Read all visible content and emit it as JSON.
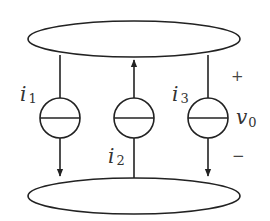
{
  "diagram": {
    "type": "circuit",
    "nodes": [
      {
        "id": "top-node",
        "shape": "ellipse"
      },
      {
        "id": "bottom-node",
        "shape": "ellipse"
      }
    ],
    "sources": [
      {
        "id": "source-1",
        "label": "i",
        "subscript": "1",
        "direction": "down"
      },
      {
        "id": "source-2",
        "label": "i",
        "subscript": "2",
        "direction": "up"
      },
      {
        "id": "source-3",
        "label": "i",
        "subscript": "3",
        "direction": "down"
      }
    ],
    "voltage": {
      "label": "v",
      "subscript": "0",
      "plus": "+",
      "minus": "−"
    },
    "colors": {
      "stroke": "#222222",
      "text": "#333333",
      "background": "#ffffff"
    }
  }
}
